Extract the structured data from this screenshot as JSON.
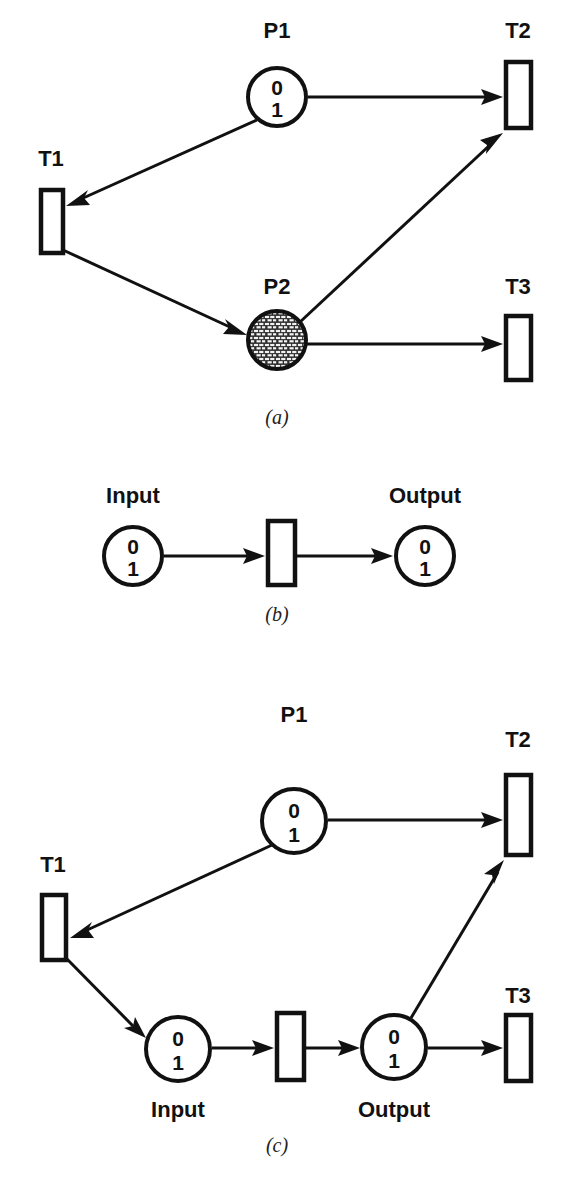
{
  "figure": {
    "background_color": "#ffffff",
    "ink_color": "#111111",
    "panels": [
      {
        "id": "a",
        "caption": "(a)",
        "caption_x": 277,
        "caption_y": 424,
        "places": [
          {
            "id": "p1",
            "label": "P1",
            "label_x": 277,
            "label_y": 38,
            "cx": 277,
            "cy": 97,
            "r": 29,
            "fill": "white",
            "tokens": [
              "0",
              "1"
            ]
          },
          {
            "id": "p2",
            "label": "P2",
            "label_x": 277,
            "label_y": 294,
            "cx": 277,
            "cy": 340,
            "r": 29,
            "fill": "brick-hatch",
            "tokens": []
          }
        ],
        "transitions": [
          {
            "id": "t1",
            "label": "T1",
            "label_x": 51,
            "label_y": 166,
            "x": 41,
            "y": 190,
            "w": 22,
            "h": 63
          },
          {
            "id": "t2",
            "label": "T2",
            "label_x": 518,
            "label_y": 38,
            "x": 506,
            "y": 62,
            "w": 25,
            "h": 66
          },
          {
            "id": "t3",
            "label": "T3",
            "label_x": 518,
            "label_y": 294,
            "x": 506,
            "y": 316,
            "w": 25,
            "h": 64
          }
        ],
        "arcs": [
          {
            "id": "p1-to-t2",
            "from": "p1",
            "to": "t2",
            "x1": 308,
            "y1": 97,
            "x2": 503,
            "y2": 97
          },
          {
            "id": "p1-to-t1",
            "from": "p1",
            "to": "t1",
            "x1": 257,
            "y1": 120,
            "x2": 66,
            "y2": 206
          },
          {
            "id": "t1-to-p2",
            "from": "t1",
            "to": "p2",
            "x1": 63,
            "y1": 250,
            "x2": 247,
            "y2": 335
          },
          {
            "id": "p2-to-t2",
            "from": "p2",
            "to": "t2",
            "x1": 300,
            "y1": 322,
            "x2": 503,
            "y2": 133
          },
          {
            "id": "p2-to-t3",
            "from": "p2",
            "to": "t3",
            "x1": 307,
            "y1": 344,
            "x2": 503,
            "y2": 344
          }
        ]
      },
      {
        "id": "b",
        "caption": "(b)",
        "caption_x": 277,
        "caption_y": 621,
        "places": [
          {
            "id": "input",
            "label": "Input",
            "label_x": 133,
            "label_y": 503,
            "cx": 133,
            "cy": 556,
            "r": 29,
            "fill": "white",
            "tokens": [
              "0",
              "1"
            ]
          },
          {
            "id": "output",
            "label": "Output",
            "label_x": 425,
            "label_y": 503,
            "cx": 425,
            "cy": 556,
            "r": 29,
            "fill": "white",
            "tokens": [
              "0",
              "1"
            ]
          }
        ],
        "transitions": [
          {
            "id": "tb",
            "label": "",
            "label_x": 0,
            "label_y": 0,
            "x": 268,
            "y": 521,
            "w": 27,
            "h": 64
          }
        ],
        "arcs": [
          {
            "id": "input-to-tb",
            "from": "input",
            "to": "tb",
            "x1": 164,
            "y1": 556,
            "x2": 265,
            "y2": 556
          },
          {
            "id": "tb-to-output",
            "from": "tb",
            "to": "output",
            "x1": 297,
            "y1": 556,
            "x2": 393,
            "y2": 556
          }
        ]
      },
      {
        "id": "c",
        "caption": "(c)",
        "caption_x": 277,
        "caption_y": 1152,
        "places": [
          {
            "id": "p1c",
            "label": "P1",
            "label_x": 294,
            "label_y": 722,
            "cx": 294,
            "cy": 821,
            "r": 32,
            "fill": "white",
            "tokens": [
              "0",
              "1"
            ]
          },
          {
            "id": "inputc",
            "label": "Input",
            "label_x": 178,
            "label_y": 1117,
            "cx": 178,
            "cy": 1049,
            "r": 32,
            "fill": "white",
            "tokens": [
              "0",
              "1"
            ]
          },
          {
            "id": "outputc",
            "label": "Output",
            "label_x": 394,
            "label_y": 1117,
            "cx": 394,
            "cy": 1047,
            "r": 32,
            "fill": "white",
            "tokens": [
              "0",
              "1"
            ]
          }
        ],
        "transitions": [
          {
            "id": "t1c",
            "label": "T1",
            "label_x": 53,
            "label_y": 872,
            "x": 42,
            "y": 895,
            "w": 24,
            "h": 65
          },
          {
            "id": "t2c",
            "label": "T2",
            "label_x": 518,
            "label_y": 747,
            "x": 506,
            "y": 775,
            "w": 25,
            "h": 80
          },
          {
            "id": "t3c",
            "label": "T3",
            "label_x": 518,
            "label_y": 1003,
            "x": 506,
            "y": 1015,
            "w": 25,
            "h": 66
          },
          {
            "id": "tbc",
            "label": "",
            "label_x": 0,
            "label_y": 0,
            "x": 277,
            "y": 1013,
            "w": 27,
            "h": 67
          }
        ],
        "arcs": [
          {
            "id": "p1c-to-t2c",
            "from": "p1c",
            "to": "t2c",
            "x1": 328,
            "y1": 820,
            "x2": 503,
            "y2": 820
          },
          {
            "id": "p1c-to-t1c",
            "from": "p1c",
            "to": "t1c",
            "x1": 272,
            "y1": 845,
            "x2": 70,
            "y2": 938
          },
          {
            "id": "t1c-to-inputc",
            "from": "t1c",
            "to": "inputc",
            "x1": 66,
            "y1": 958,
            "x2": 146,
            "y2": 1038
          },
          {
            "id": "inputc-to-tbc",
            "from": "inputc",
            "to": "tbc",
            "x1": 212,
            "y1": 1048,
            "x2": 274,
            "y2": 1048
          },
          {
            "id": "tbc-to-outputc",
            "from": "tbc",
            "to": "outputc",
            "x1": 306,
            "y1": 1048,
            "x2": 360,
            "y2": 1048
          },
          {
            "id": "outputc-to-t2c",
            "from": "outputc",
            "to": "t2c",
            "x1": 411,
            "y1": 1018,
            "x2": 504,
            "y2": 860
          },
          {
            "id": "outputc-to-t3c",
            "from": "outputc",
            "to": "t3c",
            "x1": 428,
            "y1": 1048,
            "x2": 503,
            "y2": 1048
          }
        ]
      }
    ]
  }
}
